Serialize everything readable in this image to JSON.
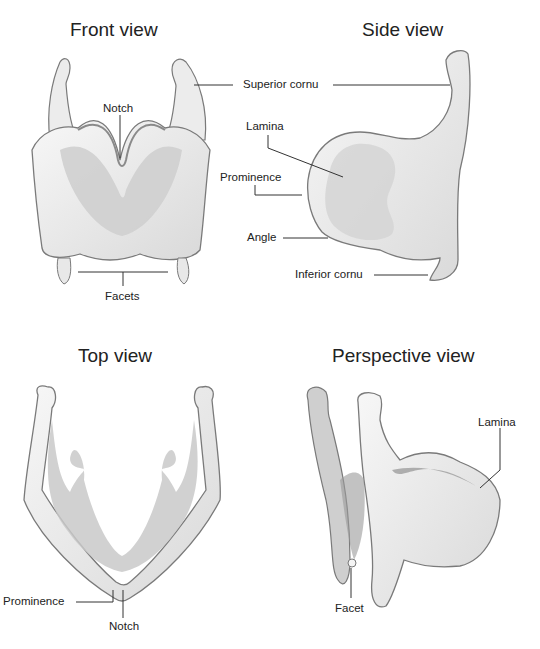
{
  "figure": {
    "panels": [
      {
        "id": "front",
        "title": "Front view",
        "labels": [
          "Notch",
          "Facets"
        ]
      },
      {
        "id": "side",
        "title": "Side view",
        "labels": [
          "Superior cornu",
          "Lamina",
          "Prominence",
          "Angle",
          "Inferior cornu"
        ]
      },
      {
        "id": "top",
        "title": "Top view",
        "labels": [
          "Prominence",
          "Notch"
        ]
      },
      {
        "id": "perspective",
        "title": "Perspective view",
        "labels": [
          "Lamina",
          "Facet"
        ]
      }
    ],
    "colors": {
      "background": "#ffffff",
      "cartilage_light": "#f2f2f2",
      "cartilage_mid": "#d6d6d6",
      "cartilage_dark": "#a8a8a8",
      "outline": "#7a7a7a",
      "leader_line": "#333333",
      "text": "#222222"
    }
  }
}
